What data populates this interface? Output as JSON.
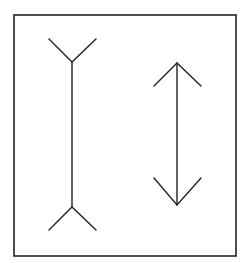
{
  "diagram": {
    "figures": [
      {
        "name": "fins-outward-line",
        "shaft": {
          "x": 72,
          "y1": 62,
          "y2": 207
        },
        "fin_style": "outward"
      },
      {
        "name": "arrowheads-inward-line",
        "shaft": {
          "x": 177,
          "y1": 63,
          "y2": 205
        },
        "fin_style": "inward"
      }
    ],
    "colors": {
      "stroke": "#222222",
      "background": "#ffffff"
    }
  }
}
